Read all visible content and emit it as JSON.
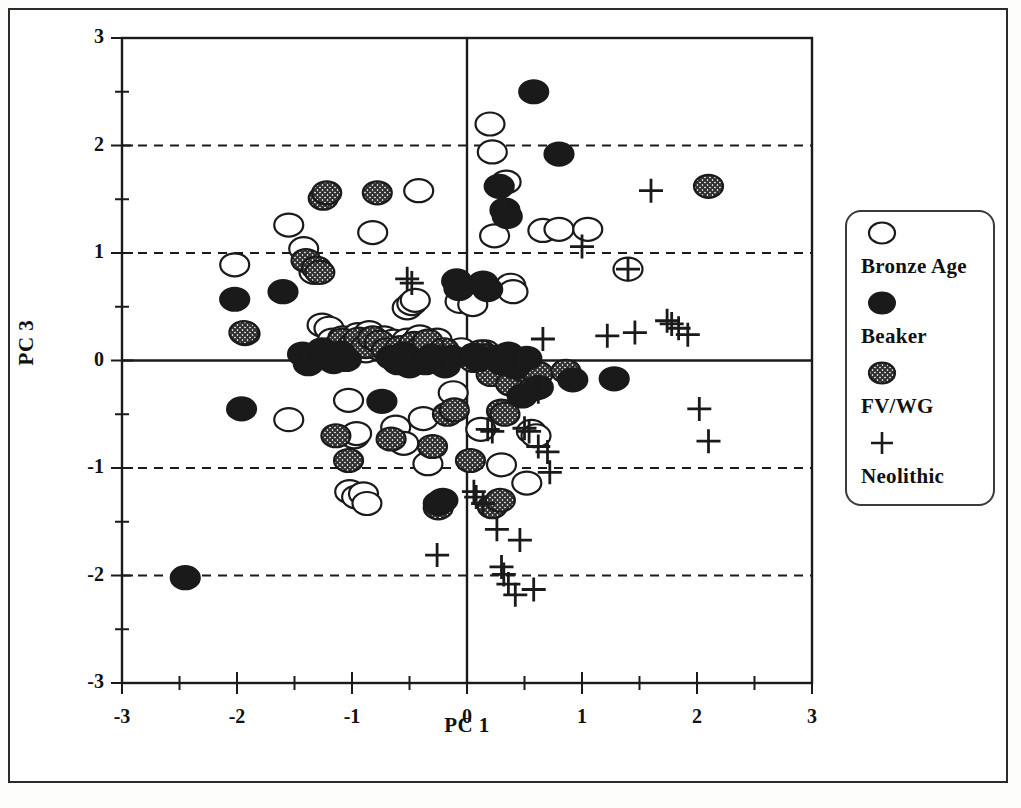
{
  "figure": {
    "type": "scatter",
    "border": true,
    "background": "#ffffff",
    "ink": "#1a1a1a"
  },
  "axes": {
    "xlabel": "PC 1",
    "ylabel": "PC 3",
    "xlim": [
      -3,
      3
    ],
    "ylim": [
      -3,
      3
    ],
    "xticks": [
      "-3",
      "-2",
      "-1",
      "0",
      "1",
      "2",
      "3"
    ],
    "yticks": [
      "3",
      "2",
      "1",
      "0",
      "-1",
      "-2",
      "-3"
    ],
    "minor_tick_step": 0.5,
    "gridlines_dashed_y": [
      2,
      1,
      -1,
      -2
    ],
    "gridlines_solid_y": [
      0
    ],
    "gridlines_solid_x": [
      0
    ]
  },
  "legend": {
    "position": "right-outside",
    "entries": [
      {
        "symbol": "open-circle",
        "label": "Bronze Age"
      },
      {
        "symbol": "filled-circle",
        "label": "Beaker"
      },
      {
        "symbol": "hatched-circle",
        "label": "FV/WG"
      },
      {
        "symbol": "plus",
        "label": "Neolithic"
      }
    ]
  },
  "chart_data": {
    "type": "scatter",
    "title": "",
    "xlabel": "PC 1",
    "ylabel": "PC 3",
    "xlim": [
      -3,
      3
    ],
    "ylim": [
      -3,
      3
    ],
    "grid": "dashed horizontal at y=-2,-1,1,2; solid at x=0 and y=0",
    "legend_position": "right",
    "series": [
      {
        "name": "Bronze Age",
        "marker": "open-circle",
        "color": "#ffffff",
        "edge": "#1a1a1a",
        "points": [
          [
            -2.02,
            0.89
          ],
          [
            -1.93,
            0.25
          ],
          [
            -1.55,
            1.26
          ],
          [
            -1.42,
            1.04
          ],
          [
            -1.33,
            0.82
          ],
          [
            -1.26,
            0.33
          ],
          [
            -1.2,
            0.3
          ],
          [
            -1.17,
            0.19
          ],
          [
            -1.13,
            0.13
          ],
          [
            -1.08,
            0.21
          ],
          [
            -1.02,
            0.06
          ],
          [
            -0.98,
            0.12
          ],
          [
            -0.95,
            0.24
          ],
          [
            -0.92,
            0.19
          ],
          [
            -0.88,
            0.09
          ],
          [
            -0.85,
            0.26
          ],
          [
            -0.82,
            1.19
          ],
          [
            -0.8,
            0.16
          ],
          [
            -0.76,
            0.11
          ],
          [
            -0.72,
            0.21
          ],
          [
            -0.68,
            0.14
          ],
          [
            -0.64,
            0.18
          ],
          [
            -0.6,
            0.08
          ],
          [
            -0.56,
            0.13
          ],
          [
            -0.52,
            0.19
          ],
          [
            -0.47,
            0.15
          ],
          [
            -0.42,
            1.58
          ],
          [
            -0.41,
            0.22
          ],
          [
            -0.36,
            0.1
          ],
          [
            -0.31,
            0.17
          ],
          [
            -0.26,
            0.19
          ],
          [
            -1.55,
            -0.55
          ],
          [
            -1.03,
            -0.37
          ],
          [
            -0.98,
            -0.71
          ],
          [
            -0.96,
            -0.68
          ],
          [
            -1.02,
            -1.22
          ],
          [
            -0.96,
            -1.27
          ],
          [
            -0.9,
            -1.24
          ],
          [
            -0.87,
            -1.33
          ],
          [
            -0.62,
            -0.62
          ],
          [
            -0.55,
            -0.77
          ],
          [
            -0.38,
            -0.54
          ],
          [
            -0.34,
            -0.96
          ],
          [
            -0.52,
            0.49
          ],
          [
            -0.48,
            0.53
          ],
          [
            -0.45,
            0.56
          ],
          [
            -0.12,
            -0.3
          ],
          [
            -0.1,
            0.06
          ],
          [
            -0.06,
            0.55
          ],
          [
            -0.05,
            0.1
          ],
          [
            0.05,
            0.52
          ],
          [
            0.08,
            0.04
          ],
          [
            0.12,
            -0.64
          ],
          [
            0.16,
            0.08
          ],
          [
            0.2,
            2.2
          ],
          [
            0.22,
            1.94
          ],
          [
            0.24,
            1.16
          ],
          [
            0.3,
            -0.97
          ],
          [
            0.34,
            1.66
          ],
          [
            0.38,
            0.7
          ],
          [
            0.4,
            0.64
          ],
          [
            0.43,
            -0.03
          ],
          [
            0.47,
            -0.07
          ],
          [
            0.52,
            -1.14
          ],
          [
            0.56,
            -0.66
          ],
          [
            0.6,
            -0.7
          ],
          [
            0.66,
            1.21
          ],
          [
            0.8,
            1.22
          ],
          [
            1.05,
            1.22
          ],
          [
            1.4,
            0.85
          ]
        ]
      },
      {
        "name": "Beaker",
        "marker": "filled-circle",
        "color": "#1a1a1a",
        "points": [
          [
            -2.45,
            -2.02
          ],
          [
            -2.02,
            0.57
          ],
          [
            -1.6,
            0.64
          ],
          [
            -1.43,
            0.06
          ],
          [
            -1.38,
            -0.03
          ],
          [
            -1.32,
            0.02
          ],
          [
            -1.26,
            0.1
          ],
          [
            -1.21,
            0.04
          ],
          [
            -1.16,
            -0.01
          ],
          [
            -1.96,
            -0.45
          ],
          [
            -1.1,
            0.07
          ],
          [
            -1.05,
            0.01
          ],
          [
            -0.74,
            -0.38
          ],
          [
            -0.66,
            0.03
          ],
          [
            -0.6,
            -0.02
          ],
          [
            -0.55,
            0.06
          ],
          [
            -0.5,
            -0.05
          ],
          [
            -0.36,
            -0.02
          ],
          [
            -0.31,
            0.04
          ],
          [
            -0.25,
            -1.33
          ],
          [
            -0.21,
            -1.3
          ],
          [
            -0.19,
            -0.05
          ],
          [
            -0.13,
            0.03
          ],
          [
            -0.09,
            0.74
          ],
          [
            -0.07,
            0.67
          ],
          [
            0.06,
            0.05
          ],
          [
            0.1,
            0.01
          ],
          [
            0.14,
            0.72
          ],
          [
            0.18,
            0.66
          ],
          [
            0.24,
            0.03
          ],
          [
            0.28,
            1.62
          ],
          [
            0.3,
            -0.02
          ],
          [
            0.33,
            1.4
          ],
          [
            0.35,
            1.34
          ],
          [
            0.36,
            0.06
          ],
          [
            0.42,
            -0.06
          ],
          [
            0.48,
            -0.33
          ],
          [
            0.52,
            0.02
          ],
          [
            0.58,
            2.5
          ],
          [
            0.62,
            -0.25
          ],
          [
            0.8,
            1.92
          ],
          [
            0.92,
            -0.18
          ],
          [
            1.28,
            -0.17
          ]
        ]
      },
      {
        "name": "FV/WG",
        "marker": "hatched-circle",
        "color": "#6d6d6d",
        "points": [
          [
            -1.94,
            0.26
          ],
          [
            -1.4,
            0.93
          ],
          [
            -1.31,
            0.86
          ],
          [
            -1.28,
            0.82
          ],
          [
            -1.25,
            1.51
          ],
          [
            -1.22,
            1.56
          ],
          [
            -1.2,
            0.07
          ],
          [
            -1.14,
            -0.7
          ],
          [
            -1.08,
            0.19
          ],
          [
            -1.03,
            -0.93
          ],
          [
            -0.99,
            0.15
          ],
          [
            -0.94,
            0.2
          ],
          [
            -0.88,
            0.13
          ],
          [
            -0.82,
            0.21
          ],
          [
            -0.78,
            1.56
          ],
          [
            -0.76,
            0.17
          ],
          [
            -0.7,
            0.1
          ],
          [
            -0.66,
            -0.73
          ],
          [
            -0.58,
            0.12
          ],
          [
            -0.52,
            0.07
          ],
          [
            -0.46,
            0.16
          ],
          [
            -0.4,
            0.11
          ],
          [
            -0.34,
            0.18
          ],
          [
            -0.3,
            -0.8
          ],
          [
            -0.26,
            0.05
          ],
          [
            -0.2,
            0.1
          ],
          [
            -0.25,
            -1.37
          ],
          [
            -0.17,
            -0.5
          ],
          [
            -0.11,
            -0.46
          ],
          [
            0.03,
            -0.93
          ],
          [
            0.06,
            0.0
          ],
          [
            0.12,
            0.08
          ],
          [
            0.17,
            0.04
          ],
          [
            0.21,
            -0.13
          ],
          [
            0.26,
            0.02
          ],
          [
            0.3,
            -0.47
          ],
          [
            0.33,
            -0.5
          ],
          [
            0.38,
            -0.22
          ],
          [
            0.44,
            -0.06
          ],
          [
            0.52,
            -0.1
          ],
          [
            0.58,
            -0.26
          ],
          [
            0.62,
            -0.12
          ],
          [
            0.22,
            -1.36
          ],
          [
            0.29,
            -1.3
          ],
          [
            0.86,
            -0.1
          ],
          [
            2.1,
            1.62
          ]
        ]
      },
      {
        "name": "Neolithic",
        "marker": "plus",
        "color": "#1a1a1a",
        "points": [
          [
            -0.52,
            0.76
          ],
          [
            -0.48,
            0.72
          ],
          [
            -0.21,
            0.08
          ],
          [
            0.18,
            -0.64
          ],
          [
            0.22,
            -0.66
          ],
          [
            0.06,
            -1.22
          ],
          [
            0.08,
            -1.27
          ],
          [
            0.14,
            -1.33
          ],
          [
            0.26,
            -1.57
          ],
          [
            0.3,
            -1.92
          ],
          [
            0.32,
            -1.99
          ],
          [
            0.36,
            -2.08
          ],
          [
            0.42,
            -2.18
          ],
          [
            0.46,
            -1.67
          ],
          [
            0.58,
            -2.13
          ],
          [
            -0.26,
            -1.81
          ],
          [
            0.5,
            -0.63
          ],
          [
            0.54,
            -0.66
          ],
          [
            0.62,
            -0.8
          ],
          [
            0.7,
            -0.85
          ],
          [
            0.72,
            -1.04
          ],
          [
            0.62,
            -0.29
          ],
          [
            0.66,
            0.2
          ],
          [
            1.0,
            1.06
          ],
          [
            1.22,
            0.23
          ],
          [
            1.4,
            0.85
          ],
          [
            1.46,
            0.26
          ],
          [
            1.6,
            1.58
          ],
          [
            1.74,
            0.37
          ],
          [
            1.78,
            0.34
          ],
          [
            1.84,
            0.3
          ],
          [
            1.92,
            0.24
          ],
          [
            2.02,
            -0.45
          ],
          [
            2.1,
            -0.75
          ]
        ]
      }
    ]
  }
}
